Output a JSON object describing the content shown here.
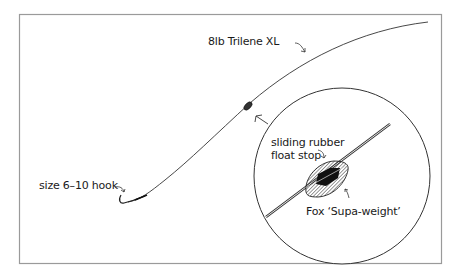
{
  "diagram": {
    "type": "fishing-rig-illustration",
    "colors": {
      "line": "#333333",
      "frame": "#9a9a9a",
      "float_fill": "#222222",
      "background": "#ffffff"
    },
    "labels": {
      "main_line": "8lb Trilene XL",
      "hook": "size 6–10 hook",
      "float_stop_line1": "sliding rubber",
      "float_stop_line2": "float stop",
      "weight": "Fox ‘Supa-weight’"
    },
    "inset": {
      "shape": "circle",
      "description": "magnified view"
    }
  }
}
